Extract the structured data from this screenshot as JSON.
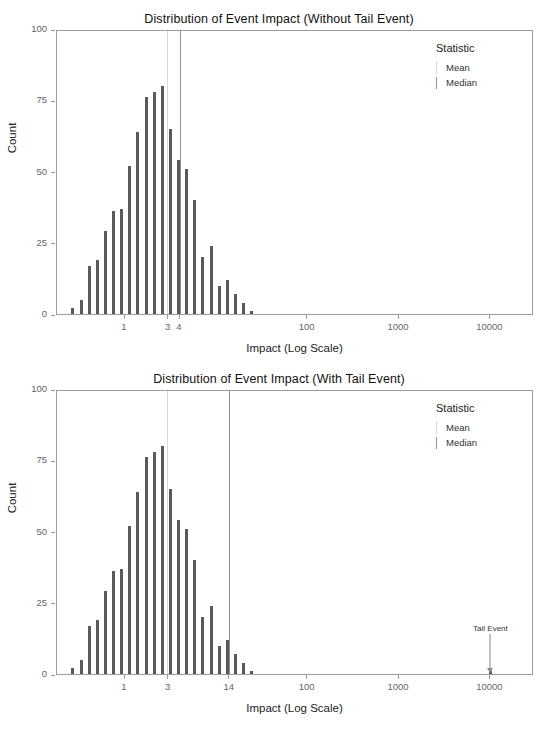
{
  "chart_data": [
    {
      "type": "bar",
      "id": "without-tail-event",
      "title": "Distribution of Event Impact (Without Tail Event)",
      "xlabel": "Impact (Log Scale)",
      "ylabel": "Count",
      "xscale": "log",
      "xlim": [
        0.18,
        30000
      ],
      "ylim": [
        0,
        100
      ],
      "yticks": [
        0,
        25,
        50,
        75,
        100
      ],
      "yticklabels": [
        "0",
        "25",
        "50",
        "75",
        "100"
      ],
      "xticks": [
        1,
        3,
        4,
        100,
        1000,
        10000
      ],
      "xticklabels": [
        "1",
        "3",
        "4",
        "100",
        "1000",
        "10000"
      ],
      "grid": false,
      "legend": {
        "title": "Statistic",
        "position": "top-right",
        "entries": [
          {
            "label": "Mean",
            "color": "#d8d8d8"
          },
          {
            "label": "Median",
            "color": "#8f8f8f"
          }
        ]
      },
      "vlines": [
        {
          "name": "Mean",
          "x": 2.93,
          "color": "#d8d8d8"
        },
        {
          "name": "Median",
          "x": 4.02,
          "color": "#8f8f8f"
        }
      ],
      "bar_color": "#5a5a5a",
      "x": [
        0.268,
        0.33,
        0.405,
        0.497,
        0.61,
        0.749,
        0.919,
        1.128,
        1.384,
        1.699,
        2.085,
        2.559,
        3.141,
        3.855,
        4.731,
        5.806,
        7.126,
        8.746,
        10.73,
        13.17,
        16.17,
        19.84,
        24.35,
        29.89,
        36.68,
        45.02
      ],
      "values": [
        2,
        5,
        17,
        19,
        29,
        36,
        37,
        52,
        64,
        76,
        78,
        80,
        65,
        54,
        51,
        40,
        20,
        24,
        10,
        12,
        7,
        4,
        1,
        0,
        0,
        0
      ]
    },
    {
      "type": "bar",
      "id": "with-tail-event",
      "title": "Distribution of Event Impact (With Tail Event)",
      "xlabel": "Impact (Log Scale)",
      "ylabel": "Count",
      "xscale": "log",
      "xlim": [
        0.18,
        30000
      ],
      "ylim": [
        0,
        100
      ],
      "yticks": [
        0,
        25,
        50,
        75,
        100
      ],
      "yticklabels": [
        "0",
        "25",
        "50",
        "75",
        "100"
      ],
      "xticks": [
        1,
        3,
        14,
        100,
        1000,
        10000
      ],
      "xticklabels": [
        "1",
        "3",
        "14",
        "100",
        "1000",
        "10000"
      ],
      "grid": false,
      "legend": {
        "title": "Statistic",
        "position": "top-right",
        "entries": [
          {
            "label": "Mean",
            "color": "#d8d8d8"
          },
          {
            "label": "Median",
            "color": "#8f8f8f"
          }
        ]
      },
      "vlines": [
        {
          "name": "Mean",
          "x": 2.95,
          "color": "#d8d8d8"
        },
        {
          "name": "Median",
          "x": 13.9,
          "color": "#8f8f8f"
        }
      ],
      "annotations": [
        {
          "text": "Tail Event",
          "x": 10000,
          "y": 14,
          "arrow_to_y": 1
        }
      ],
      "bar_color": "#5a5a5a",
      "x": [
        0.268,
        0.33,
        0.405,
        0.497,
        0.61,
        0.749,
        0.919,
        1.128,
        1.384,
        1.699,
        2.085,
        2.559,
        3.141,
        3.855,
        4.731,
        5.806,
        7.126,
        8.746,
        10.73,
        13.17,
        16.17,
        19.84,
        24.35,
        29.89,
        36.68,
        10000
      ],
      "values": [
        2,
        5,
        17,
        19,
        29,
        36,
        37,
        52,
        64,
        76,
        78,
        80,
        65,
        54,
        51,
        40,
        20,
        24,
        10,
        12,
        7,
        4,
        1,
        0,
        0,
        1
      ]
    }
  ],
  "panels": {
    "top": {
      "title": "Distribution of Event Impact (Without Tail Event)",
      "xlabel": "Impact (Log Scale)",
      "ylabel": "Count",
      "legend_title": "Statistic",
      "legend_mean": "Mean",
      "legend_median": "Median"
    },
    "bottom": {
      "title": "Distribution of Event Impact (With Tail Event)",
      "xlabel": "Impact (Log Scale)",
      "ylabel": "Count",
      "legend_title": "Statistic",
      "legend_mean": "Mean",
      "legend_median": "Median",
      "annotation_label": "Tail Event"
    }
  },
  "colors": {
    "bar": "#5a5a5a",
    "mean_line": "#d8d8d8",
    "median_line": "#8f8f8f",
    "axis": "#9b9b9b",
    "tick_text": "#666666"
  }
}
